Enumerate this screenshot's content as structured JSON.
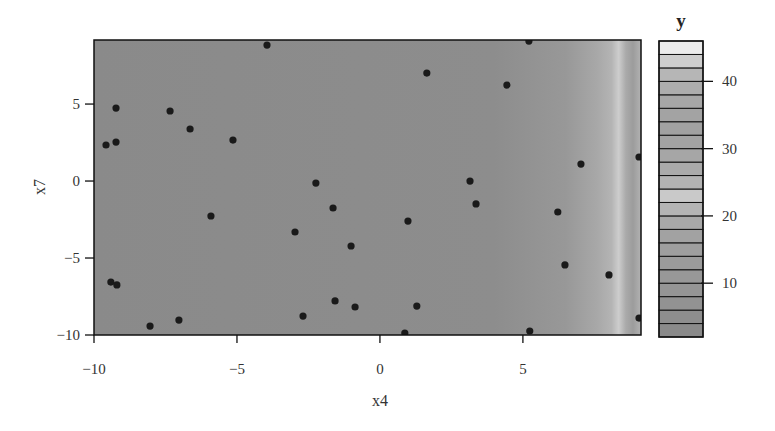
{
  "chart_data": {
    "type": "heatmap",
    "subtype": "filled-contour-with-scatter",
    "title": "",
    "xlabel": "x4",
    "ylabel": "x7",
    "xlim": [
      -10,
      9.13
    ],
    "ylim": [
      -10,
      9.16
    ],
    "xticks": [
      -10,
      -5,
      0,
      5
    ],
    "xtick_labels": [
      "−10",
      "−5",
      "0",
      "5"
    ],
    "yticks": [
      -10,
      -5,
      0,
      5
    ],
    "ytick_labels": [
      "−10",
      "−5",
      "0",
      "5"
    ],
    "grid": false,
    "background_gradient_along_x": [
      {
        "x": -10,
        "color": "#8a8a8a"
      },
      {
        "x": 4.0,
        "color": "#8d8d8d"
      },
      {
        "x": 6.5,
        "color": "#989898"
      },
      {
        "x": 7.6,
        "color": "#a8a8a8"
      },
      {
        "x": 8.1,
        "color": "#b4b4b4"
      },
      {
        "x": 8.35,
        "color": "#cdcdcd"
      },
      {
        "x": 8.6,
        "color": "#aaaaaa"
      },
      {
        "x": 8.85,
        "color": "#9c9c9c"
      },
      {
        "x": 9.13,
        "color": "#b2b2b2"
      }
    ],
    "points": {
      "x4": [
        -3.95,
        -9.23,
        -7.34,
        -6.64,
        -5.14,
        -9.58,
        -9.23,
        1.64,
        4.44,
        5.21,
        7.03,
        9.06,
        3.15,
        -2.24,
        -1.64,
        -2.97,
        -1.01,
        0.98,
        3.36,
        6.22,
        6.47,
        8.01,
        9.06,
        5.24,
        -5.91,
        -9.41,
        -9.2,
        -8.04,
        -7.03,
        -1.57,
        -0.87,
        -2.69,
        1.29,
        0.87
      ],
      "x7": [
        8.83,
        4.74,
        4.55,
        3.38,
        2.66,
        2.34,
        2.53,
        7.01,
        6.23,
        9.09,
        1.1,
        1.56,
        0.0,
        -0.13,
        -1.75,
        -3.31,
        -4.22,
        -2.6,
        -1.49,
        -2.01,
        -5.45,
        -6.1,
        -8.9,
        -9.74,
        -2.27,
        -6.56,
        -6.75,
        -9.42,
        -9.03,
        -7.79,
        -8.18,
        -8.77,
        -8.12,
        -9.87
      ],
      "color": "#1a1a1a"
    },
    "legend": {
      "title": "y",
      "position": "right",
      "range": [
        2,
        46
      ],
      "ticks": [
        10,
        20,
        30,
        40
      ],
      "tick_labels": [
        "10",
        "20",
        "30",
        "40"
      ],
      "levels": [
        2,
        4,
        6,
        8,
        10,
        12,
        14,
        16,
        18,
        20,
        22,
        24,
        26,
        28,
        30,
        32,
        34,
        36,
        38,
        40,
        42,
        44,
        46
      ],
      "band_colors": [
        "#8a8a8a",
        "#8e8e8e",
        "#929292",
        "#959595",
        "#989898",
        "#9b9b9b",
        "#9e9e9e",
        "#a2a2a2",
        "#a8a8a8",
        "#b4b4b4",
        "#c9c9c9",
        "#b3b3b3",
        "#aaaaaa",
        "#a6a6a6",
        "#a3a3a3",
        "#a1a1a1",
        "#a3a3a3",
        "#a7a7a7",
        "#adadad",
        "#b6b6b6",
        "#cecece",
        "#ececec"
      ]
    }
  }
}
